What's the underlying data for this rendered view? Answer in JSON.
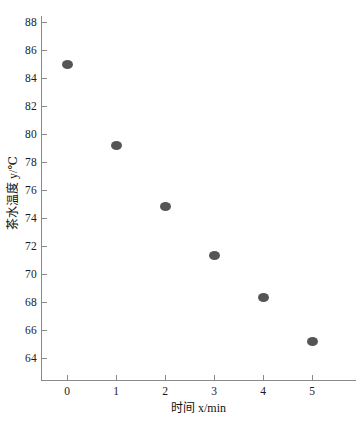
{
  "chart_data": {
    "type": "scatter",
    "title": "",
    "xlabel": "时间 x/min",
    "ylabel": "茶水温度 y/℃",
    "x": [
      0,
      1,
      2,
      3,
      4,
      5
    ],
    "values": [
      85.0,
      79.2,
      74.8,
      71.3,
      68.3,
      65.2
    ],
    "points": [
      {
        "x": 0,
        "y": 85.0
      },
      {
        "x": 1,
        "y": 79.2
      },
      {
        "x": 2,
        "y": 74.8
      },
      {
        "x": 3,
        "y": 71.3
      },
      {
        "x": 4,
        "y": 68.3
      },
      {
        "x": 5,
        "y": 65.2
      }
    ],
    "xticks": [
      "0",
      "1",
      "2",
      "3",
      "4",
      "5"
    ],
    "yticks": [
      "64",
      "66",
      "68",
      "70",
      "72",
      "74",
      "76",
      "78",
      "80",
      "82",
      "84",
      "86",
      "88"
    ],
    "xlim": [
      -0.35,
      6.0
    ],
    "ylim": [
      62.6,
      88.6
    ],
    "grid": false,
    "legend": false,
    "marker_color": "#555555",
    "axis_color": "#8a8a8a"
  }
}
